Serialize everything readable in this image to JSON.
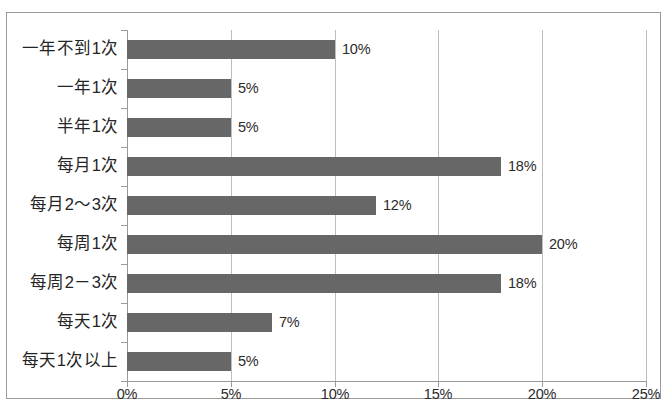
{
  "chart_data": {
    "type": "bar",
    "orientation": "horizontal",
    "title": "",
    "subtitle": "",
    "xlabel": "",
    "ylabel": "",
    "categories": [
      "一年不到1次",
      "一年1次",
      "半年1次",
      "每月1次",
      "每月2～3次",
      "每周1次",
      "每周2－3次",
      "每天1次",
      "每天1次以上"
    ],
    "values": [
      10,
      5,
      5,
      18,
      12,
      20,
      18,
      7,
      5
    ],
    "data_labels": [
      "10%",
      "5%",
      "5%",
      "18%",
      "12%",
      "20%",
      "18%",
      "7%",
      "5%"
    ],
    "xlim": [
      0,
      25
    ],
    "x_ticks": [
      0,
      5,
      10,
      15,
      20,
      25
    ],
    "x_tick_labels": [
      "0%",
      "5%",
      "10%",
      "15%",
      "20%",
      "25%"
    ],
    "grid": true,
    "grid_axis": "x",
    "legend": false,
    "legend_position": "none",
    "bar_color": "#676767",
    "grid_color": "#bdbdbd",
    "axis_color": "#9a9a9a",
    "text_color": "#2b2b2b",
    "frame_color": "#9a9a9a",
    "background": "#ffffff"
  }
}
